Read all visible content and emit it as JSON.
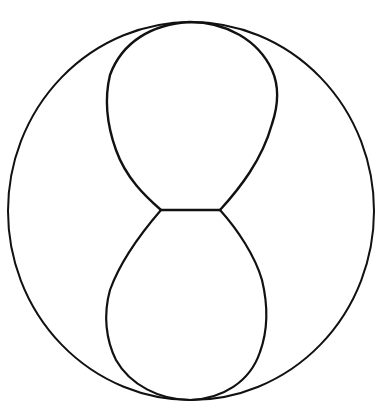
{
  "diagram": {
    "type": "line-drawing",
    "colors": {
      "stroke": "#111111",
      "background": "#ffffff"
    },
    "outer_circle": {
      "cx": 191,
      "cy": 211,
      "rx": 183,
      "ry": 189,
      "stroke_width": 2
    },
    "inner_shape": {
      "kind": "figure-eight / hourglass",
      "waist": {
        "x1": 161,
        "x2": 220,
        "y": 210
      },
      "upper_lobe": {
        "top_y": 22,
        "left_x": 107,
        "right_x": 278
      },
      "lower_lobe": {
        "bottom_y": 400,
        "left_x": 106,
        "right_x": 267
      },
      "stroke_width": 2.4
    }
  }
}
